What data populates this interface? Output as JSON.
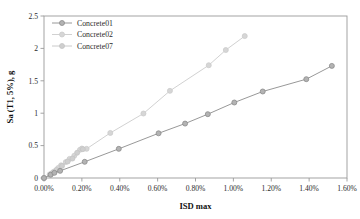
{
  "chart_data": {
    "type": "line",
    "title": "",
    "xlabel": "ISD max",
    "ylabel": "Sa (T1, 5%), g",
    "xlim": [
      0,
      1.6
    ],
    "ylim": [
      0,
      2.5
    ],
    "xticks": [
      "0.00%",
      "0.20%",
      "0.40%",
      "0.60%",
      "0.80%",
      "1.00%",
      "1.20%",
      "1.40%",
      "1.60%"
    ],
    "xtick_values": [
      0,
      0.2,
      0.4,
      0.6,
      0.8,
      1.0,
      1.2,
      1.4,
      1.6
    ],
    "yticks": [
      "0",
      "0.5",
      "1",
      "1.5",
      "2",
      "2.5"
    ],
    "ytick_values": [
      0,
      0.5,
      1,
      1.5,
      2,
      2.5
    ],
    "grid": false,
    "legend_position": "top-left-inside",
    "marker": "circle",
    "series": [
      {
        "name": "Concrete01",
        "color": "#8c8c8c",
        "marker_fill": "#b3b3b3",
        "points": [
          [
            0.0,
            0.0
          ],
          [
            0.035,
            0.05
          ],
          [
            0.055,
            0.08
          ],
          [
            0.085,
            0.11
          ],
          [
            0.215,
            0.25
          ],
          [
            0.395,
            0.45
          ],
          [
            0.605,
            0.69
          ],
          [
            0.745,
            0.84
          ],
          [
            0.865,
            0.985
          ],
          [
            1.005,
            1.165
          ],
          [
            1.155,
            1.335
          ],
          [
            1.385,
            1.525
          ],
          [
            1.52,
            1.73
          ]
        ]
      },
      {
        "name": "Concrete02",
        "color": "#cccccc",
        "marker_fill": "#d6d6d6",
        "points": [
          [
            0.0,
            0.0
          ],
          [
            0.03,
            0.055
          ],
          [
            0.05,
            0.095
          ],
          [
            0.075,
            0.155
          ],
          [
            0.09,
            0.195
          ],
          [
            0.115,
            0.245
          ],
          [
            0.135,
            0.295
          ],
          [
            0.16,
            0.345
          ],
          [
            0.19,
            0.435
          ],
          [
            0.2,
            0.455
          ],
          [
            0.225,
            0.45
          ],
          [
            0.35,
            0.695
          ],
          [
            0.525,
            0.995
          ],
          [
            0.665,
            1.345
          ],
          [
            0.87,
            1.74
          ],
          [
            0.96,
            1.975
          ],
          [
            1.06,
            2.19
          ]
        ]
      },
      {
        "name": "Concrete07",
        "color": "#c4c4c4",
        "marker_fill": "#cfcfcf",
        "points": [
          [
            0.0,
            0.0
          ],
          [
            0.04,
            0.07
          ],
          [
            0.065,
            0.125
          ],
          [
            0.095,
            0.185
          ],
          [
            0.125,
            0.255
          ],
          [
            0.15,
            0.3
          ],
          [
            0.175,
            0.39
          ],
          [
            0.205,
            0.445
          ]
        ]
      }
    ]
  },
  "legend": {
    "items": [
      {
        "label": "Concrete01"
      },
      {
        "label": "Concrete02"
      },
      {
        "label": "Concrete07"
      }
    ]
  }
}
